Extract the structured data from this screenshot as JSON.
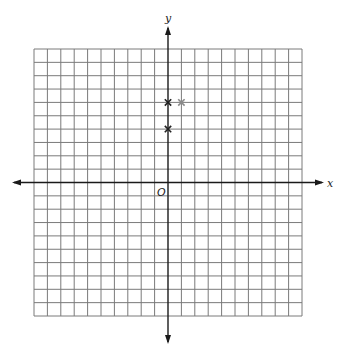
{
  "chart_data": {
    "type": "scatter",
    "title": "",
    "xlabel": "x",
    "ylabel": "y",
    "origin_label": "O",
    "xlim": [
      -10,
      10
    ],
    "ylim": [
      -10,
      10
    ],
    "grid": true,
    "grid_step": 1,
    "tick_labels": false,
    "series": [
      {
        "name": "black-markers",
        "marker": "x",
        "color": "#222222",
        "points": [
          {
            "x": 0,
            "y": 6
          },
          {
            "x": 0,
            "y": 4
          }
        ]
      },
      {
        "name": "gray-marker",
        "marker": "asterisk",
        "color": "#8a8a8a",
        "points": [
          {
            "x": 1,
            "y": 6
          }
        ]
      }
    ]
  }
}
